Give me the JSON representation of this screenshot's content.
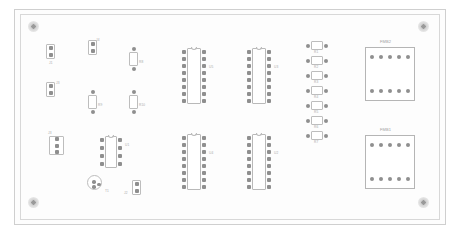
{
  "document": {
    "type": "pcb-layout-drawing",
    "title": "Printed circuit board assembly drawing",
    "background_color": "#ffffff",
    "board_color": "#fdfdfd",
    "silkscreen_color": "#b9b9b9",
    "pad_color": "#8f8f8f",
    "text_color": "#a8a8a8"
  },
  "board": {
    "outer": {
      "x": 14,
      "y": 9,
      "w": 432,
      "h": 216
    },
    "inner": {
      "x": 20,
      "y": 14,
      "w": 420,
      "h": 206
    }
  },
  "mounting_holes": [
    {
      "name": "hole-top-left",
      "x": 33,
      "y": 26,
      "d": 11
    },
    {
      "name": "hole-top-right",
      "x": 423,
      "y": 26,
      "d": 11
    },
    {
      "name": "hole-bottom-left",
      "x": 33,
      "y": 202,
      "d": 11
    },
    {
      "name": "hole-bottom-right",
      "x": 423,
      "y": 202,
      "d": 11
    }
  ],
  "components": {
    "integrated_circuits": [
      {
        "ref": "U5",
        "x": 182,
        "y": 48,
        "w": 24,
        "h": 56,
        "pins": 16,
        "label_x": 209,
        "label_y": 66
      },
      {
        "ref": "U3",
        "x": 247,
        "y": 48,
        "w": 24,
        "h": 56,
        "pins": 16,
        "label_x": 274,
        "label_y": 66
      },
      {
        "ref": "U4",
        "x": 182,
        "y": 134,
        "w": 24,
        "h": 56,
        "pins": 16,
        "label_x": 209,
        "label_y": 152
      },
      {
        "ref": "U2",
        "x": 247,
        "y": 134,
        "w": 24,
        "h": 56,
        "pins": 16,
        "label_x": 274,
        "label_y": 152
      },
      {
        "ref": "U1",
        "x": 100,
        "y": 136,
        "w": 22,
        "h": 32,
        "pins": 8,
        "label_x": 125,
        "label_y": 144
      }
    ],
    "resistors_horizontal": [
      {
        "ref": "R1",
        "x": 306,
        "y": 41,
        "w": 22,
        "h": 9
      },
      {
        "ref": "R2",
        "x": 306,
        "y": 56,
        "w": 22,
        "h": 9
      },
      {
        "ref": "R3",
        "x": 306,
        "y": 71,
        "w": 22,
        "h": 9
      },
      {
        "ref": "R4",
        "x": 306,
        "y": 86,
        "w": 22,
        "h": 9
      },
      {
        "ref": "R5",
        "x": 306,
        "y": 101,
        "w": 22,
        "h": 9
      },
      {
        "ref": "R6",
        "x": 306,
        "y": 116,
        "w": 22,
        "h": 9
      },
      {
        "ref": "R7",
        "x": 306,
        "y": 131,
        "w": 22,
        "h": 9
      }
    ],
    "resistors_vertical": [
      {
        "ref": "R8",
        "x": 129,
        "y": 47,
        "w": 9,
        "h": 24
      },
      {
        "ref": "R9",
        "x": 88,
        "y": 90,
        "w": 9,
        "h": 24
      },
      {
        "ref": "R10",
        "x": 129,
        "y": 90,
        "w": 9,
        "h": 24
      }
    ],
    "headers": [
      {
        "ref": "J1",
        "x": 46,
        "y": 44,
        "w": 9,
        "h": 15,
        "pins": 2,
        "label_x": 49,
        "label_y": 62
      },
      {
        "ref": "J3",
        "x": 46,
        "y": 82,
        "w": 9,
        "h": 15,
        "pins": 2,
        "label_x": 56,
        "label_y": 82
      },
      {
        "ref": "J4",
        "x": 88,
        "y": 40,
        "w": 9,
        "h": 15,
        "pins": 2,
        "label_x": 96,
        "label_y": 39
      },
      {
        "ref": "J3",
        "x": 49,
        "y": 136,
        "w": 15,
        "h": 19,
        "pins": 3,
        "label_x": 48,
        "label_y": 132
      },
      {
        "ref": "J2",
        "x": 132,
        "y": 180,
        "w": 9,
        "h": 15,
        "pins": 2,
        "label_x": 124,
        "label_y": 192
      }
    ],
    "transistors": [
      {
        "ref": "T1",
        "x": 87,
        "y": 175,
        "d": 15,
        "label_x": 105,
        "label_y": 190
      }
    ],
    "modules": [
      {
        "ref": "FMB2",
        "x": 365,
        "y": 47,
        "w": 50,
        "h": 54,
        "pins_per_row": 5,
        "label_x": 380,
        "label_y": 40
      },
      {
        "ref": "FMB1",
        "x": 365,
        "y": 135,
        "w": 50,
        "h": 54,
        "pins_per_row": 5,
        "label_x": 380,
        "label_y": 128
      }
    ]
  }
}
